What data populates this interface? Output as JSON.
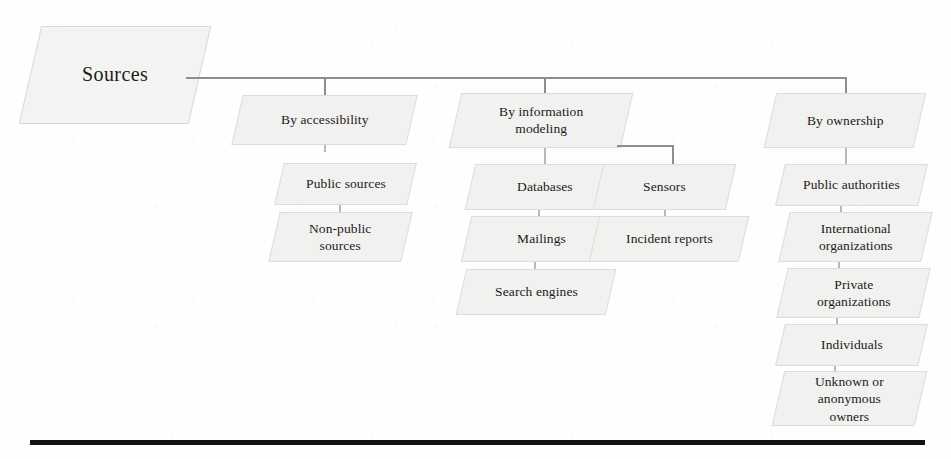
{
  "diagram": {
    "title": "Sources",
    "root": {
      "label": "Sources"
    },
    "branches": [
      {
        "id": "by-accessibility",
        "head": "By accessibility",
        "items": [
          "Public sources",
          "Non-public\nsources"
        ]
      },
      {
        "id": "by-information-modeling",
        "head": "By information\nmodeling",
        "items": [
          "Databases",
          "Mailings",
          "Search engines"
        ],
        "sub_branch": {
          "id": "sensors",
          "items": [
            "Sensors",
            "Incident reports"
          ]
        }
      },
      {
        "id": "by-ownership",
        "head": "By ownership",
        "items": [
          "Public authorities",
          "International\norganizations",
          "Private\norganizations",
          "Individuals",
          "Unknown or\nanonymous\nowners"
        ]
      }
    ],
    "colors": {
      "node_fill": "#f1f1ef",
      "node_border": "#dcdcd8",
      "connector": "#8d8d8d",
      "text": "#1b1b1b",
      "rule": "#111111",
      "background": "#fefefe"
    }
  }
}
